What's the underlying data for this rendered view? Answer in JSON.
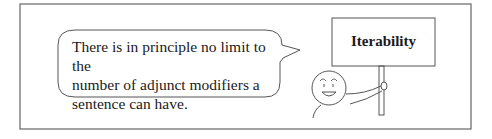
{
  "speech_bubble": {
    "lines": [
      "There is in principle no limit to the",
      "number of adjunct modifiers a",
      "sentence can have."
    ]
  },
  "sign": {
    "label": "Iterability"
  },
  "colors": {
    "stroke": "#555555",
    "text": "#1a1a1a",
    "background": "#ffffff"
  }
}
